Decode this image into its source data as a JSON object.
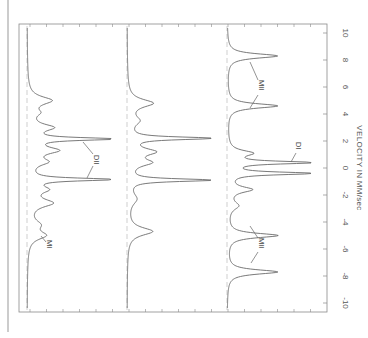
{
  "chart_data": {
    "type": "line",
    "title": "",
    "orientation": "rotated-90",
    "xlabel": "VELOCITY IN MM/sec",
    "ylabel": "",
    "xlim": [
      -10,
      10
    ],
    "x_ticks": [
      -10,
      -8,
      -6,
      -4,
      -2,
      0,
      2,
      4,
      6,
      8,
      10
    ],
    "x_tick_labels": [
      "-10",
      "-8",
      "-6",
      "-4",
      "-2",
      "0",
      "2",
      "4",
      "6",
      "8",
      "10"
    ],
    "grid": false,
    "legend": null,
    "series": [
      {
        "name": "Spectrum 1",
        "peaks": [
          {
            "v": 5.0,
            "depth": 0.28,
            "width": 0.35
          },
          {
            "v": 4.1,
            "depth": 0.1,
            "width": 0.3
          },
          {
            "v": 3.0,
            "depth": 0.28,
            "width": 0.3
          },
          {
            "v": 2.15,
            "depth": 1.0,
            "width": 0.12
          },
          {
            "v": 1.3,
            "depth": 0.33,
            "width": 0.3
          },
          {
            "v": 0.45,
            "depth": 0.2,
            "width": 0.3
          },
          {
            "v": -0.85,
            "depth": 1.0,
            "width": 0.12
          },
          {
            "v": -1.6,
            "depth": 0.2,
            "width": 0.3
          },
          {
            "v": -2.6,
            "depth": 0.28,
            "width": 0.35
          },
          {
            "v": -4.2,
            "depth": 0.12,
            "width": 0.4
          },
          {
            "v": -5.0,
            "depth": 0.2,
            "width": 0.35
          }
        ],
        "annotations": [
          {
            "text": "MI",
            "v": -5.3
          },
          {
            "text": "DII",
            "v": 0.6
          }
        ]
      },
      {
        "name": "Spectrum 2",
        "peaks": [
          {
            "v": 4.8,
            "depth": 0.3,
            "width": 0.35
          },
          {
            "v": 3.5,
            "depth": 0.12,
            "width": 0.4
          },
          {
            "v": 2.2,
            "depth": 1.0,
            "width": 0.12
          },
          {
            "v": 1.2,
            "depth": 0.3,
            "width": 0.3
          },
          {
            "v": 0.4,
            "depth": 0.25,
            "width": 0.3
          },
          {
            "v": -0.9,
            "depth": 1.0,
            "width": 0.12
          },
          {
            "v": -2.3,
            "depth": 0.1,
            "width": 0.5
          },
          {
            "v": -4.7,
            "depth": 0.3,
            "width": 0.35
          }
        ],
        "annotations": []
      },
      {
        "name": "Spectrum 3",
        "peaks": [
          {
            "v": 8.3,
            "depth": 0.6,
            "width": 0.2
          },
          {
            "v": 4.6,
            "depth": 0.6,
            "width": 0.2
          },
          {
            "v": 1.1,
            "depth": 0.28,
            "width": 0.25
          },
          {
            "v": 0.4,
            "depth": 1.0,
            "width": 0.12
          },
          {
            "v": -0.4,
            "depth": 1.0,
            "width": 0.12
          },
          {
            "v": -1.6,
            "depth": 0.28,
            "width": 0.25
          },
          {
            "v": -2.8,
            "depth": 0.12,
            "width": 0.35
          },
          {
            "v": -5.0,
            "depth": 0.6,
            "width": 0.2
          },
          {
            "v": -7.7,
            "depth": 0.6,
            "width": 0.2
          }
        ],
        "annotations": [
          {
            "text": "MII",
            "v": 6.5
          },
          {
            "text": "DI",
            "v": 1.8
          },
          {
            "text": "MII",
            "v": -6.2
          }
        ]
      }
    ]
  },
  "labels": {
    "axis_title": "VELOCITY IN MM/sec",
    "tick_labels": [
      "-10",
      "-8",
      "-6",
      "-4",
      "-2",
      "0",
      "2",
      "4",
      "6",
      "8",
      "10"
    ],
    "annotation_MI": "MI",
    "annotation_DII": "DII",
    "annotation_MII_upper": "MII",
    "annotation_MII_lower": "MII",
    "annotation_DI": "DI"
  },
  "colors": {
    "line": "#6a6a6a",
    "frame": "#8a8a8a",
    "baseline": "#b0b0b0",
    "text": "#555555"
  }
}
